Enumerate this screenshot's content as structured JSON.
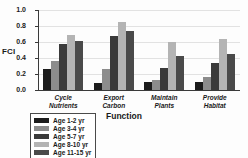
{
  "chart_data": {
    "type": "bar",
    "title": "",
    "xlabel": "Function",
    "ylabel": "FCI",
    "ylim": [
      0.0,
      1.0
    ],
    "ytick_labels": [
      "1.0",
      "0.8",
      "0.6",
      "0.4",
      "0.2",
      "0.0"
    ],
    "ytick_values": [
      1.0,
      0.8,
      0.6,
      0.4,
      0.2,
      0.0
    ],
    "grid": true,
    "legend_position": "below-left",
    "categories": [
      "Cycle Nutrients",
      "Export Carbon",
      "Maintain Plants",
      "Provide Habitat"
    ],
    "category_lines": [
      [
        "Cycle",
        "Nutrients"
      ],
      [
        "Export",
        "Carbon"
      ],
      [
        "Maintain",
        "Plants"
      ],
      [
        "Provide",
        "Habitat"
      ]
    ],
    "series": [
      {
        "name": "Age 1-2 yr",
        "color": "#1c1c1c",
        "values": [
          0.26,
          0.09,
          0.1,
          0.1
        ]
      },
      {
        "name": "Age 3-4 yr",
        "color": "#8c8c8c",
        "values": [
          0.36,
          0.26,
          0.12,
          0.16
        ]
      },
      {
        "name": "Age 5-7 yr",
        "color": "#3a3a3a",
        "values": [
          0.58,
          0.67,
          0.27,
          0.34
        ]
      },
      {
        "name": "Age 8-10 yr",
        "color": "#b4b4b4",
        "values": [
          0.69,
          0.85,
          0.6,
          0.64
        ]
      },
      {
        "name": "Age 11-15 yr",
        "color": "#4a4a4a",
        "values": [
          0.61,
          0.74,
          0.43,
          0.45
        ]
      }
    ]
  },
  "legend": {
    "items": [
      {
        "label": "Age 1-2 yr",
        "color": "#1c1c1c"
      },
      {
        "label": "Age 3-4 yr",
        "color": "#8c8c8c"
      },
      {
        "label": "Age 5-7 yr",
        "color": "#3a3a3a"
      },
      {
        "label": "Age 8-10 yr",
        "color": "#b4b4b4"
      },
      {
        "label": "Age 11-15 yr",
        "color": "#4a4a4a"
      }
    ]
  }
}
